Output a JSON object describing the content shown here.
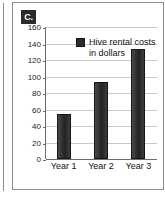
{
  "panel": {
    "part_label": "C."
  },
  "chart_data": {
    "type": "bar",
    "title": "",
    "subtitle": "",
    "xlabel": "",
    "ylabel": "",
    "categories": [
      "Year 1",
      "Year 2",
      "Year 3"
    ],
    "values": [
      54,
      93,
      133
    ],
    "series": [
      {
        "name": "Hive rental costs in dollars",
        "values": [
          54,
          93,
          133
        ]
      }
    ],
    "legend": {
      "position": "inside-top-left",
      "entries": [
        "Hive rental costs in dollars"
      ]
    },
    "ylim": [
      0,
      160
    ],
    "ytick_step": 20,
    "yticks": [
      "160",
      "140",
      "120",
      "100",
      "80",
      "60",
      "40",
      "20",
      "0"
    ],
    "grid": true,
    "bar_color": "#2c2c2c",
    "grid_color": "#c9c9c9",
    "axis_color": "#6e6e6e"
  }
}
